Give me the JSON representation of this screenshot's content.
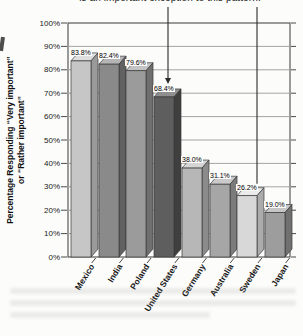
{
  "figure": {
    "annotation_top": "is an important exception to this pattern.",
    "ylabel_line1": "Percentage Responding “Very important”",
    "ylabel_line2": "or “Rather important”"
  },
  "chart_data": {
    "type": "bar",
    "style": "3d-column",
    "title": "",
    "xlabel": "",
    "ylabel": "Percentage Responding “Very important” or “Rather important”",
    "categories": [
      "Mexico",
      "India",
      "Poland",
      "United States",
      "Germany",
      "Australia",
      "Sweden",
      "Japan"
    ],
    "values": [
      83.8,
      82.4,
      79.6,
      68.4,
      38.0,
      31.1,
      26.2,
      19.0
    ],
    "value_labels": [
      "83.8%",
      "82.4%",
      "79.6%",
      "68.4%",
      "38.0%",
      "31.1%",
      "26.2%",
      "19.0%"
    ],
    "ytick_labels": [
      "0%",
      "10%",
      "20%",
      "30%",
      "40%",
      "50%",
      "60%",
      "70%",
      "80%",
      "90%",
      "100%"
    ],
    "ylim": [
      0,
      100
    ],
    "grid": "horizontal every 10%",
    "legend": "none",
    "annotations": [
      {
        "text": "is an important exception to this pattern.",
        "position": "top, partially cropped",
        "targets": [
          "United States",
          "Sweden"
        ]
      }
    ],
    "bar_colors": [
      {
        "front": "#c6c6c6",
        "side": "#9a9a9a",
        "top": "#dedede"
      },
      {
        "front": "#8a8a8a",
        "side": "#616161",
        "top": "#b5b5b5"
      },
      {
        "front": "#9b9b9b",
        "side": "#6f6f6f",
        "top": "#c3c3c3"
      },
      {
        "front": "#5e5e5e",
        "side": "#3f3f3f",
        "top": "#8f8f8f"
      },
      {
        "front": "#b7b7b7",
        "side": "#8b8b8b",
        "top": "#d5d5d5"
      },
      {
        "front": "#a6a6a6",
        "side": "#7b7b7b",
        "top": "#cacaca"
      },
      {
        "front": "#d8d8d8",
        "side": "#ababab",
        "top": "#ebebeb"
      },
      {
        "front": "#9d9d9d",
        "side": "#707070",
        "top": "#c6c6c6"
      }
    ],
    "palette": {
      "paper": "#fcfcfb",
      "frame": "#4a4a4a",
      "grid": "#9a9a9a",
      "text": "#1a1a1a",
      "callout": "#2a2a2a",
      "bar_outline": "#3a3a3a"
    }
  }
}
